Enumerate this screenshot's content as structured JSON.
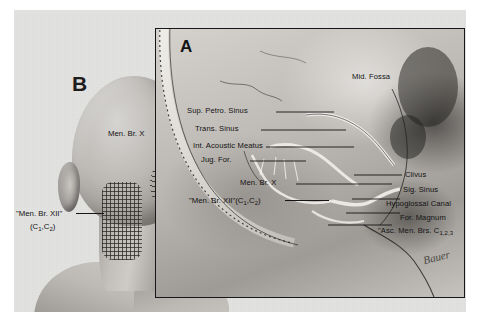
{
  "figure": {
    "type": "anatomical-illustration",
    "background_color": "#ffffff",
    "plate_color": "#e3e3e1"
  },
  "panels": [
    {
      "id": "A",
      "letter": "A",
      "description": "Sagittal cut-away of the posterior and middle cranial fossae showing meningeal branches and venous sinuses",
      "frame_color": "#17171a",
      "labels": [
        {
          "name": "sup-petrosal-sinus",
          "text": "Sup. Petro. Sinus"
        },
        {
          "name": "transverse-sinus",
          "text": "Trans. Sinus"
        },
        {
          "name": "internal-acoustic-meatus",
          "text": "Int. Acoustic Meatus"
        },
        {
          "name": "jugular-foramen",
          "text": "Jug. For."
        },
        {
          "name": "mid-fossa",
          "text": "Mid. Fossa"
        },
        {
          "name": "meningeal-branch-x",
          "text": "Men. Br. X"
        },
        {
          "name": "clivus",
          "text": "Clivus"
        },
        {
          "name": "sigmoid-sinus",
          "text": "Sig. Sinus"
        },
        {
          "name": "hypoglossal-canal",
          "text": "Hypoglossal Canal"
        },
        {
          "name": "foramen-magnum",
          "text": "For. Magnum"
        }
      ]
    },
    {
      "id": "B",
      "letter": "B",
      "description": "Posterior view of head and neck showing referred cutaneous fields of the meningeal branches",
      "labels": [
        {
          "name": "meningeal-branch-x",
          "text": "Men. Br. X"
        }
      ],
      "patches": [
        {
          "name": "grid-hatched-field",
          "hatch": "cross-hatch",
          "refers_to": "\"Men. Br. XII\" (C1,C2)"
        },
        {
          "name": "diagonal-hatched-field",
          "hatch": "diagonal",
          "refers_to": "Men. Br. X"
        }
      ]
    }
  ],
  "captions": {
    "men_br_xii_left_line1": "\"Men. Br. XII\"",
    "men_br_xii_left_line2": "(C",
    "men_br_xii_left_sub1": "1",
    "men_br_xii_left_mid": ",C",
    "men_br_xii_left_sub2": "2",
    "men_br_xii_left_end": ")",
    "men_br_xii_center": "\"Men. Br. XII\"(C",
    "men_br_xii_center_sub1": "1",
    "men_br_xii_center_mid": ",C",
    "men_br_xii_center_sub2": "2",
    "men_br_xii_center_end": ")",
    "asc_men_brs": "\"Asc. Men. Brs. C",
    "asc_men_brs_sub": "1,2,3",
    "artist_signature": "Bauer"
  },
  "colors": {
    "ink": "#131313",
    "plate": "#cdcac6",
    "frame": "#17171a",
    "page": "#e3e3e1"
  }
}
